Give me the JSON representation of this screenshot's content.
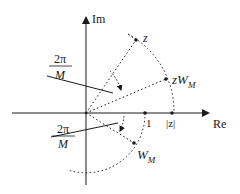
{
  "diagram": {
    "axes": {
      "real_label": "Re",
      "imag_label": "Im"
    },
    "points": {
      "z": "z",
      "zW_main": "zW",
      "zW_sub": "M",
      "W_main": "W",
      "W_sub": "M",
      "one": "1",
      "abs_z": "|z|"
    },
    "angle_labels": {
      "upper_num": "2π",
      "upper_den": "M",
      "lower_num": "2π",
      "lower_den": "M"
    },
    "colors": {
      "line": "#1a1a1a",
      "background": "#ffffff"
    }
  }
}
